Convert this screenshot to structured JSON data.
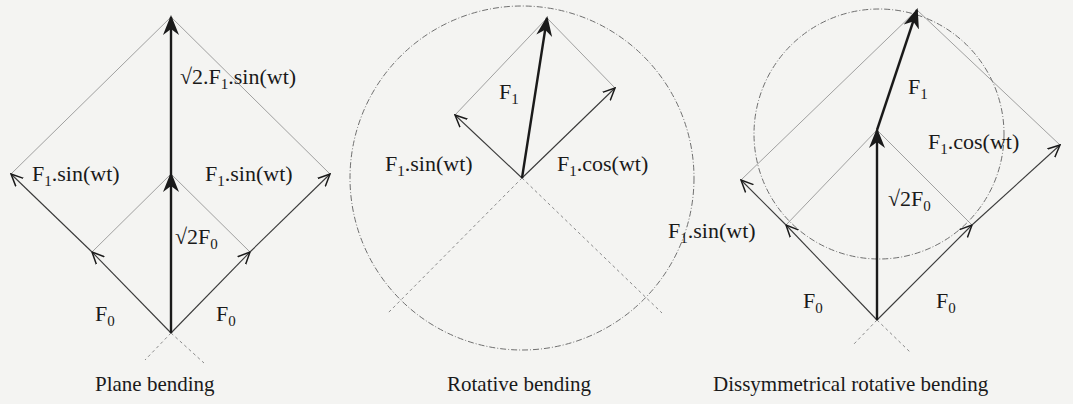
{
  "diagrams": [
    {
      "id": "plane",
      "caption": "Plane bending",
      "labels": {
        "top_vector": "√2.F",
        "top_vector_sub": "1",
        "top_vector_tail": ".sin(wt)",
        "left_vector": "F",
        "left_vector_sub": "1",
        "left_vector_tail": ".sin(wt)",
        "right_vector": "F",
        "right_vector_sub": "1",
        "right_vector_tail": ".sin(wt)",
        "mid_vector": "√2F",
        "mid_vector_sub": "0",
        "left_base": "F",
        "left_base_sub": "0",
        "right_base": "F",
        "right_base_sub": "0"
      }
    },
    {
      "id": "rotative",
      "caption": "Rotative bending",
      "labels": {
        "main_vector": "F",
        "main_vector_sub": "1",
        "sin_vector": "F",
        "sin_vector_sub": "1",
        "sin_vector_tail": ".sin(wt)",
        "cos_vector": "F",
        "cos_vector_sub": "1",
        "cos_vector_tail": ".cos(wt)"
      }
    },
    {
      "id": "dissymmetrical",
      "caption": "Dissymmetrical rotative bending",
      "labels": {
        "main_vector": "F",
        "main_vector_sub": "1",
        "cos_vector": "F",
        "cos_vector_sub": "1",
        "cos_vector_tail": ".cos(wt)",
        "mid_vector": "√2F",
        "mid_vector_sub": "0",
        "sin_vector": "F",
        "sin_vector_sub": "1",
        "sin_vector_tail": ".sin(wt)",
        "left_base": "F",
        "left_base_sub": "0",
        "right_base": "F",
        "right_base_sub": "0"
      }
    }
  ],
  "colors": {
    "background": "#f4f4f2",
    "ink": "#1a1a1a",
    "thin_line": "#6f6f6f",
    "dashed_line": "#8a8a8a"
  }
}
